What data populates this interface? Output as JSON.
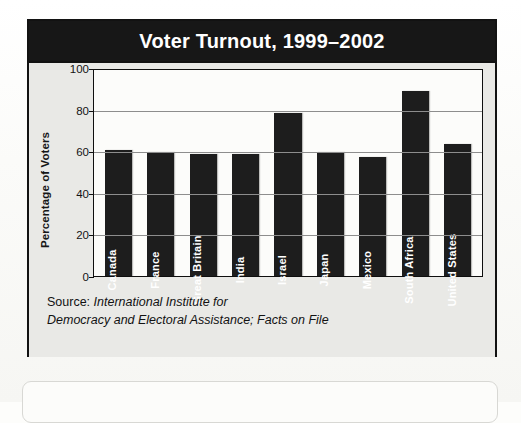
{
  "figure": {
    "title": "Voter Turnout, 1999–2002",
    "source_lead": "Source:",
    "source_line1": "International Institute for",
    "source_line2": "Democracy and Electoral Assistance; Facts on File"
  },
  "colors": {
    "title_bar": "#171717",
    "figure_background": "#e9e9e6",
    "plot_background": "#fcfcfa",
    "bar_fill": "#1d1d1d",
    "frame": "#121212",
    "gridline": "#8d8d8d",
    "label_text": "#ffffff"
  },
  "chart_data": {
    "type": "bar",
    "title": "Voter Turnout, 1999–2002",
    "xlabel": "",
    "ylabel": "Percentage of Voters",
    "ylim": [
      0,
      100
    ],
    "yticks": [
      0,
      20,
      40,
      60,
      80,
      100
    ],
    "grid": true,
    "legend": "none",
    "categories": [
      "Canada",
      "France",
      "Great Britain",
      "India",
      "Israel",
      "Japan",
      "Mexico",
      "South Africa",
      "United States"
    ],
    "values": [
      61,
      60,
      59,
      59,
      79,
      60,
      58,
      90,
      64
    ]
  }
}
